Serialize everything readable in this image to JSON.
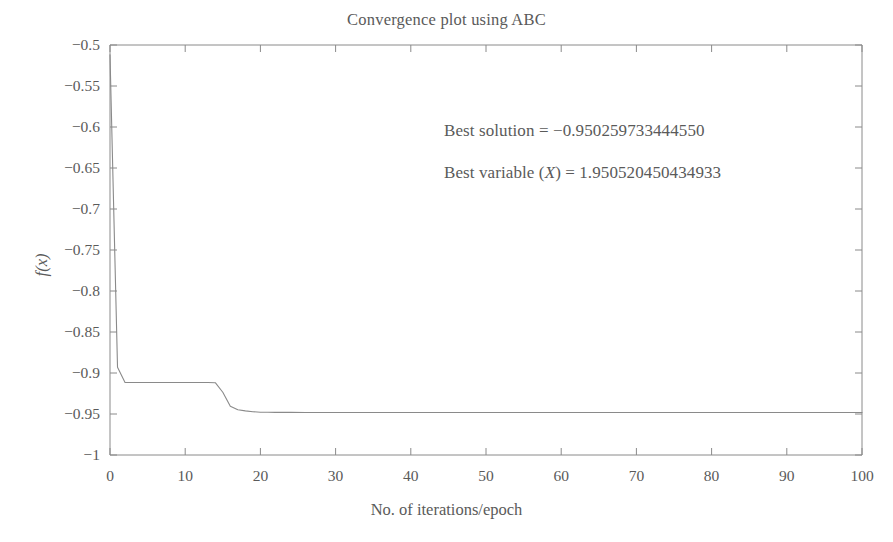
{
  "chart_data": {
    "type": "line",
    "title": "Convergence plot using ABC",
    "xlabel": "No. of iterations/epoch",
    "ylabel": "f(x)",
    "xlim": [
      0,
      100
    ],
    "ylim": [
      -1,
      -0.5
    ],
    "grid": false,
    "legend": null,
    "xticks": [
      0,
      10,
      20,
      30,
      40,
      50,
      60,
      70,
      80,
      90,
      100
    ],
    "xtick_labels": [
      "0",
      "10",
      "20",
      "30",
      "40",
      "50",
      "60",
      "70",
      "80",
      "90",
      "100"
    ],
    "yticks": [
      -0.5,
      -0.55,
      -0.6,
      -0.65,
      -0.7,
      -0.75,
      -0.8,
      -0.85,
      -0.9,
      -0.95,
      -1
    ],
    "ytick_labels": [
      "−0.5",
      "−0.55",
      "−0.6",
      "−0.65",
      "−0.7",
      "−0.75",
      "−0.8",
      "−0.85",
      "−0.9",
      "−0.95",
      "−1"
    ],
    "line_color": "#8a8a8a",
    "series": [
      {
        "name": "best fitness",
        "x": [
          0,
          1,
          2,
          3,
          4,
          5,
          6,
          7,
          8,
          9,
          10,
          11,
          12,
          13,
          14,
          15,
          16,
          17,
          18,
          19,
          20,
          21,
          22,
          24,
          26,
          30,
          40,
          50,
          60,
          70,
          80,
          90,
          100
        ],
        "values": [
          -0.512,
          -0.893,
          -0.9115,
          -0.9115,
          -0.9115,
          -0.9115,
          -0.9115,
          -0.9115,
          -0.9115,
          -0.9115,
          -0.9115,
          -0.9115,
          -0.9115,
          -0.9115,
          -0.9118,
          -0.9235,
          -0.9405,
          -0.9448,
          -0.9462,
          -0.9472,
          -0.9478,
          -0.9479,
          -0.948,
          -0.948,
          -0.9481,
          -0.9481,
          -0.9481,
          -0.9481,
          -0.9481,
          -0.9481,
          -0.9481,
          -0.9481,
          -0.9481
        ]
      }
    ],
    "annotations": [
      {
        "id": "solution",
        "prefix": "Best solution = ",
        "value": "−0.950259733444550"
      },
      {
        "id": "variable",
        "prefix": "Best variable (",
        "symbol": "X",
        "middle": ") = ",
        "value": "1.950520450434933"
      }
    ]
  },
  "colors": {
    "axis": "#8a8a8a",
    "text": "#5a5a5a",
    "line": "#8a8a8a",
    "background": "#ffffff"
  }
}
